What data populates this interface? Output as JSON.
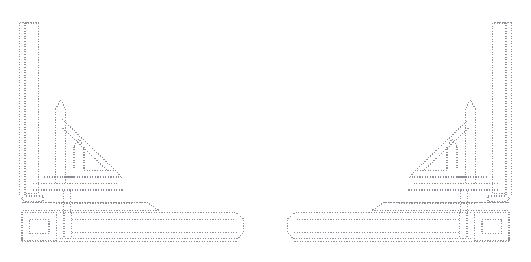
{
  "canvas": {
    "width": 531,
    "height": 262,
    "background_color": "#ffffff",
    "title": "Dotted Kufic Calligraphy Ornament"
  },
  "artwork": {
    "kind": "line-art",
    "style": "dotted-outline",
    "script": "Arabic square Kufic",
    "word": "الله",
    "transliteration": "Allah",
    "description": "Mirrored pair of dotted outline Kufic calligraphy corner ornaments",
    "symmetry": "horizontal-mirror",
    "mirror_axis_x": 265.5,
    "stroke_color": "#8e8e96",
    "stroke_width": 1.1,
    "dot_pattern": "1.15 1.45",
    "fill": "none"
  },
  "panels": [
    {
      "id": "left-ornament",
      "label": "Left corner ornament",
      "orientation": "normal",
      "bounds": {
        "x": 17,
        "y": 20,
        "width": 228,
        "height": 222
      }
    },
    {
      "id": "right-ornament",
      "label": "Right corner ornament",
      "orientation": "mirrored",
      "bounds": {
        "x": 286,
        "y": 20,
        "width": 228,
        "height": 222
      }
    }
  ],
  "strokes": {
    "alif": {
      "name": "alif-tall-stroke",
      "path": "M 19.5 22.5 L 19.5 196.5 L 24.5 201.5 L 43.0 201.5 L 43.0 196.0 L 25.0 196.0 L 25.0 22.5 Z M 25.0 22.5 L 38.5 22.5 L 38.5 193.0 L 25.0 193.0"
    },
    "lam_first": {
      "name": "lam-first-vertical",
      "path": "M 56.0 108.0 L 60.5 100.5 L 65.0 108.0 L 65.0 184.5 L 56.0 184.5 Z"
    },
    "lam_first_base": {
      "name": "lam-first-baseline",
      "path": "M 33.0 184.0 L 118.0 184.0 L 118.0 190.0 L 33.0 190.0 Z"
    },
    "lam_second": {
      "name": "lam-second-wedge",
      "path": "M 74.5 146.0 L 79.5 139.5 L 84.0 146.0 L 84.0 170.5 L 110.5 170.5 L 116.0 177.0 L 74.5 177.0 Z"
    },
    "diagonal_tail": {
      "name": "diagonal-sweep",
      "path": "M 62.0 177.0 L 62.0 171.0 L 114.0 171.0 L 62.5 120.0"
    },
    "mid_connector": {
      "name": "mid-connector-bar",
      "path": "M 44.0 177.5 L 132.0 177.5"
    },
    "upper_tail": {
      "name": "upper-long-tail",
      "path": "M 22.5 196.5 L 22.5 202.5 L 148.0 202.5 L 159.5 210.5 L 22.5 210.5"
    },
    "lower_tail": {
      "name": "lower-long-tail",
      "path": "M 60.0 214.5 L 238.5 214.5 L 243.5 220.0 L 243.5 232.5 L 238.0 238.0 L 60.0 238.0 Z"
    },
    "ha_loop_outer": {
      "name": "ha-loop-outer",
      "path": "M 22.0 212.5 L 56.0 212.5 L 56.0 240.5 L 22.0 240.5 Z"
    },
    "ha_loop_inner": {
      "name": "ha-loop-inner",
      "path": "M 29.5 219.5 L 49.0 219.5 L 49.0 233.5 L 29.5 233.5 Z"
    },
    "baseline_foot": {
      "name": "baseline-foot",
      "path": "M 22.0 236.0 L 22.0 241.5 L 238.0 241.5"
    },
    "riser_short": {
      "name": "riser-short-stem",
      "path": "M 63.5 190.0 L 63.5 202.0 M 70.0 190.0 L 70.0 202.0"
    },
    "riser_inner": {
      "name": "riser-inner-stem",
      "path": "M 63.5 203.5 L 63.5 212.0 M 70.0 203.5 L 70.0 212.0"
    },
    "crossbar_low": {
      "name": "crossbar-low",
      "path": "M 56.0 203.0 L 132.0 203.0"
    }
  },
  "palette": {
    "background": "#ffffff",
    "ink": "#8e8e96",
    "ink_light": "#b4b4bc"
  }
}
